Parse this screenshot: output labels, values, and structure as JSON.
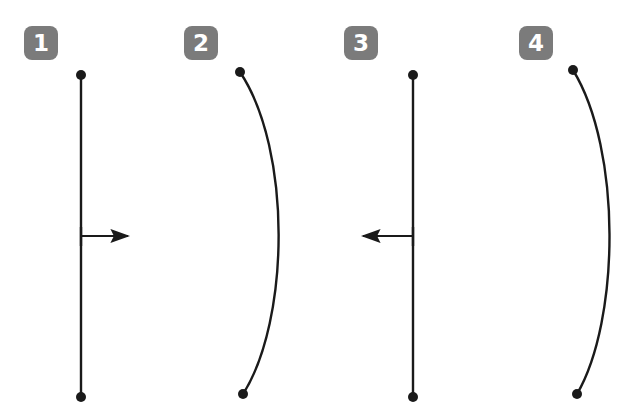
{
  "canvas": {
    "width": 619,
    "height": 418,
    "background": "#ffffff",
    "stroke_color": "#1a1a1a",
    "badge_color": "#7b7b7b",
    "badge_text_color": "#ffffff"
  },
  "badges": [
    {
      "label": "1",
      "x": 24,
      "y": 26
    },
    {
      "label": "2",
      "x": 184,
      "y": 26
    },
    {
      "label": "3",
      "x": 344,
      "y": 26
    },
    {
      "label": "4",
      "x": 519,
      "y": 26
    }
  ],
  "figures": [
    {
      "id": "figure-1",
      "kind": "straight-line-with-right-arrow",
      "line": {
        "x1": 81,
        "y1": 75,
        "x2": 81,
        "y2": 397
      },
      "endpoint_dots": [
        {
          "cx": 81,
          "cy": 75,
          "r": 5
        },
        {
          "cx": 81,
          "cy": 397,
          "r": 5
        }
      ],
      "arrow": {
        "x1": 81,
        "y1": 236,
        "x2": 135,
        "y2": 236,
        "direction": "right"
      },
      "tick": {
        "x": 81,
        "y1": 227,
        "y2": 246
      }
    },
    {
      "id": "figure-2",
      "kind": "curve-bowing-right",
      "curve": {
        "x1": 240,
        "y1": 72,
        "cx1": 292,
        "cy1": 150,
        "cx2": 290,
        "cy2": 320,
        "x2": 243,
        "y2": 394
      },
      "endpoint_dots": [
        {
          "cx": 240,
          "cy": 72,
          "r": 5
        },
        {
          "cx": 243,
          "cy": 394,
          "r": 5
        }
      ],
      "arrow": null
    },
    {
      "id": "figure-3",
      "kind": "straight-line-with-left-arrow",
      "line": {
        "x1": 413,
        "y1": 75,
        "x2": 413,
        "y2": 397
      },
      "endpoint_dots": [
        {
          "cx": 413,
          "cy": 75,
          "r": 5
        },
        {
          "cx": 413,
          "cy": 397,
          "r": 5
        }
      ],
      "arrow": {
        "x1": 413,
        "y1": 236,
        "x2": 356,
        "y2": 236,
        "direction": "left"
      },
      "tick": {
        "x": 413,
        "y1": 227,
        "y2": 246
      }
    },
    {
      "id": "figure-4",
      "kind": "curve-bowing-right",
      "curve": {
        "x1": 573,
        "y1": 70,
        "cx1": 622,
        "cy1": 150,
        "cx2": 620,
        "cy2": 320,
        "x2": 577,
        "y2": 394
      },
      "endpoint_dots": [
        {
          "cx": 573,
          "cy": 70,
          "r": 5
        },
        {
          "cx": 577,
          "cy": 394,
          "r": 5
        }
      ],
      "arrow": null
    }
  ]
}
